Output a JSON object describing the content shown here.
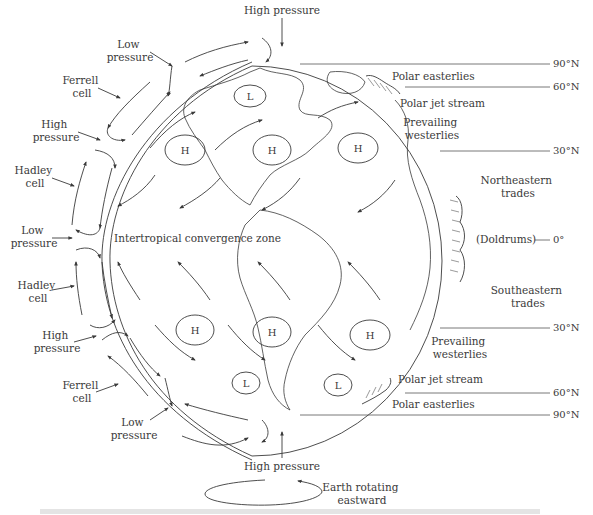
{
  "figure": {
    "type": "diagram",
    "caption_legible": false
  },
  "top": {
    "high_pressure_label": "High pressure"
  },
  "bottom": {
    "high_pressure_label": "High pressure",
    "rotation_label_line1": "Earth rotating",
    "rotation_label_line2": "eastward"
  },
  "left_labels": [
    {
      "id": "low-pressure-north",
      "line1": "Low",
      "line2": "pressure"
    },
    {
      "id": "ferrell-cell-north",
      "line1": "Ferrell",
      "line2": "cell"
    },
    {
      "id": "high-pressure-north",
      "line1": "High",
      "line2": "pressure"
    },
    {
      "id": "hadley-cell-north",
      "line1": "Hadley",
      "line2": "cell"
    },
    {
      "id": "low-pressure-equator",
      "line1": "Low",
      "line2": "pressure"
    },
    {
      "id": "hadley-cell-south",
      "line1": "Hadley",
      "line2": "cell"
    },
    {
      "id": "high-pressure-south",
      "line1": "High",
      "line2": "pressure"
    },
    {
      "id": "ferrell-cell-south",
      "line1": "Ferrell",
      "line2": "cell"
    },
    {
      "id": "low-pressure-south",
      "line1": "Low",
      "line2": "pressure"
    }
  ],
  "globe_labels": {
    "itcz": "Intertropical convergence zone",
    "pressure_systems": [
      "L",
      "H",
      "H",
      "H",
      "H",
      "H",
      "H",
      "L",
      "L"
    ]
  },
  "right_labels": {
    "polar_easterlies_north": "Polar easterlies",
    "polar_jet_stream_north": "Polar jet stream",
    "prevailing_westerlies_north_line1": "Prevailing",
    "prevailing_westerlies_north_line2": "westerlies",
    "northeastern_trades_line1": "Northeastern",
    "northeastern_trades_line2": "trades",
    "doldrums": "(Doldrums)",
    "southeastern_trades_line1": "Southeastern",
    "southeastern_trades_line2": "trades",
    "prevailing_westerlies_south_line1": "Prevailing",
    "prevailing_westerlies_south_line2": "westerlies",
    "polar_jet_stream_south": "Polar jet stream",
    "polar_easterlies_south": "Polar easterlies"
  },
  "latitudes": {
    "note": "Southern-hemisphere labels are printed as 'N' in the source figure; transcribed as shown.",
    "north": [
      "90°N",
      "60°N",
      "30°N"
    ],
    "equator": "0°",
    "south": [
      "30°N",
      "60°N",
      "90°N"
    ]
  }
}
